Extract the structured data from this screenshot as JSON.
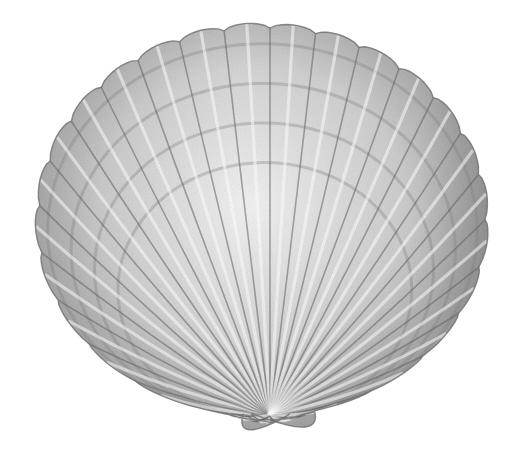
{
  "image": {
    "subject": "scallop shell",
    "style": "graphite pencil drawing",
    "background": "#ffffff",
    "shell": {
      "umbo": [
        270,
        420
      ],
      "center": [
        262,
        220
      ],
      "rx": 226,
      "ry": 196,
      "rib_count": 30,
      "growth_bands": 4,
      "colors": {
        "light": "#e6e6e6",
        "mid": "#a8a8a8",
        "dark": "#5a5a5a",
        "outline": "#6e6e6e"
      }
    }
  }
}
